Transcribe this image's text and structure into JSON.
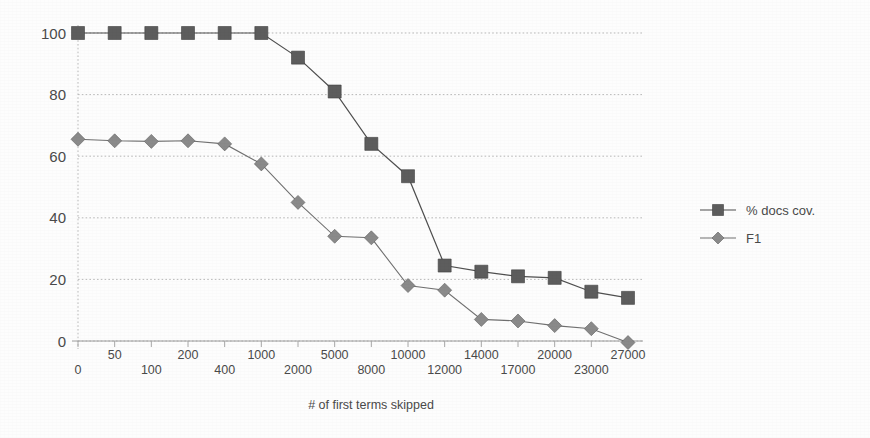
{
  "chart_data": {
    "type": "line",
    "title": "",
    "xlabel": "# of first terms skipped",
    "ylabel": "",
    "ylim": [
      0,
      100
    ],
    "yticks": [
      0,
      20,
      40,
      60,
      80,
      100
    ],
    "grid": true,
    "legend_position": "right",
    "categories": [
      "0",
      "50",
      "100",
      "200",
      "400",
      "1000",
      "2000",
      "5000",
      "8000",
      "10000",
      "12000",
      "14000",
      "17000",
      "20000",
      "23000",
      "27000"
    ],
    "series": [
      {
        "name": "% docs cov.",
        "marker": "square",
        "color": "#5d5d5d",
        "values": [
          100,
          100,
          100,
          100,
          100,
          100,
          92,
          81,
          64,
          53.5,
          24.5,
          22.5,
          21,
          20.5,
          16,
          14
        ]
      },
      {
        "name": "F1",
        "marker": "diamond",
        "color": "#8a8a8a",
        "values": [
          65.5,
          65,
          64.8,
          65,
          64,
          57.5,
          45,
          34,
          33.5,
          18,
          16.5,
          7,
          6.5,
          5,
          4,
          -0.5
        ]
      }
    ],
    "xtick_labels_row_top": [
      "50",
      "200",
      "1000",
      "5000",
      "10000",
      "14000",
      "20000",
      "27000"
    ],
    "xtick_labels_row_bottom": [
      "0",
      "100",
      "400",
      "2000",
      "8000",
      "12000",
      "17000",
      "23000"
    ]
  },
  "legend": {
    "items": [
      {
        "label": "% docs cov."
      },
      {
        "label": "F1"
      }
    ]
  },
  "axes": {
    "x_title": "# of first terms skipped"
  }
}
